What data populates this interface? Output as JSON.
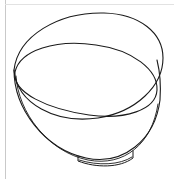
{
  "image": {
    "subject": "bowl",
    "style": "line-drawing",
    "description": "Black outline contour sketch of a tilted round bowl seen from above at an angle",
    "background_color": "#ffffff",
    "stroke_color": "#1a1a1a",
    "stroke_width": 1.1,
    "width": 174,
    "height": 179
  },
  "frame": {
    "left_border_color": "#c9c9c9",
    "top_border_color": "#e2e2e2",
    "has_left_border": true,
    "has_top_border": true
  },
  "shapes": {
    "outer_rim": {
      "name": "outer-rim-ellipse",
      "path": "M 14,70 C 18,36 58,12 104,13 C 140,14 163,33 163,58 C 163,86 136,112 98,118 C 56,124 17,104 14,70 Z"
    },
    "inner_rim": {
      "name": "inner-rim-ellipse",
      "path": "M 15,72 C 20,50 56,39 96,45 C 133,50 158,70 157,90 C 156,110 125,120 89,115 C 48,109 12,93 15,72 Z"
    },
    "bowl_body": {
      "name": "bowl-body-outline",
      "path": "M 14,70 C 14,108 44,149 86,158 C 123,166 155,140 160,100 C 161,86 160,72 157,60"
    },
    "bowl_body_inner": {
      "name": "bowl-body-inner-line",
      "path": "M 16,76 C 18,112 48,152 88,160 C 124,167 152,144 158,104"
    },
    "foot_ring": {
      "name": "foot-ring",
      "path": "M 78,156 L 78,161 C 96,168 120,168 133,158 L 133,151"
    },
    "foot_ring_inner": {
      "name": "foot-ring-inner-line",
      "path": "M 79,160 C 98,166 120,165 132,157"
    }
  }
}
